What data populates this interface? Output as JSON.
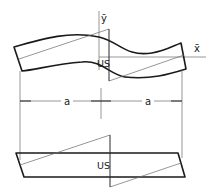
{
  "diagram": {
    "type": "engineering-sketch",
    "axes": {
      "x_label": "x̄",
      "y_label": "ȳ"
    },
    "upper_figure": {
      "description": "deformed (curved) beam segment",
      "center_label": "US"
    },
    "lower_figure": {
      "description": "sheared parallelogram beam segment",
      "center_label": "US"
    },
    "dimensions": [
      {
        "label": "a",
        "span": "left"
      },
      {
        "label": "a",
        "span": "right"
      }
    ],
    "colors": {
      "line": "#1a1a1a",
      "construction": "#6a6a6a",
      "background": "#ffffff"
    }
  }
}
